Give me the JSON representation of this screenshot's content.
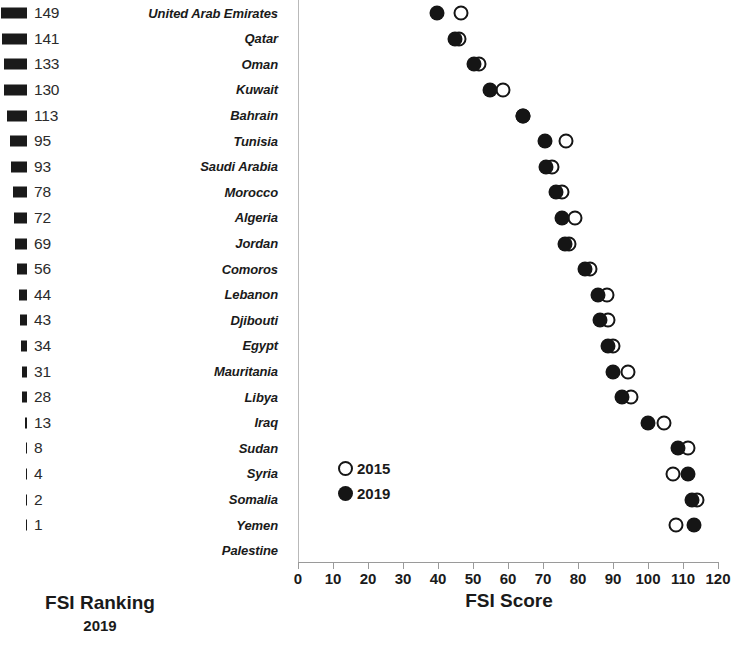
{
  "chart_data": {
    "type": "scatter",
    "title": "",
    "xlabel": "FSI Score",
    "ylabel": "",
    "xlim": [
      0,
      120
    ],
    "xticks": [
      0,
      10,
      20,
      30,
      40,
      50,
      60,
      70,
      80,
      90,
      100,
      110,
      120
    ],
    "grid": false,
    "legend_position": "inside-lower-left",
    "legend": [
      {
        "name": "2015",
        "marker": "open-circle",
        "color": "#151515"
      },
      {
        "name": "2019",
        "marker": "filled-circle",
        "color": "#151515"
      }
    ],
    "categories": [
      "United Arab Emirates",
      "Qatar",
      "Oman",
      "Kuwait",
      "Bahrain",
      "Tunisia",
      "Saudi Arabia",
      "Morocco",
      "Algeria",
      "Jordan",
      "Comoros",
      "Lebanon",
      "Djibouti",
      "Egypt",
      "Mauritania",
      "Libya",
      "Iraq",
      "Sudan",
      "Syria",
      "Somalia",
      "Yemen",
      "Palestine"
    ],
    "series": [
      {
        "name": "2015",
        "values": [
          46.6,
          46.0,
          51.7,
          58.6,
          64.3,
          76.6,
          72.6,
          75.4,
          79.1,
          77.4,
          83.4,
          88.3,
          88.6,
          90.0,
          94.3,
          95.1,
          104.5,
          111.4,
          107.1,
          114.0,
          108.0,
          null
        ]
      },
      {
        "name": "2019",
        "values": [
          39.7,
          44.9,
          50.3,
          54.9,
          64.3,
          70.6,
          70.9,
          73.7,
          75.4,
          76.3,
          82.0,
          85.7,
          86.3,
          88.6,
          90.0,
          92.6,
          100.0,
          108.6,
          111.4,
          112.6,
          113.1,
          null
        ]
      }
    ]
  },
  "rank_panel": {
    "caption_line1": "FSI Ranking",
    "caption_line2": "2019",
    "max_rank": 149,
    "rows": [
      {
        "rank": "149",
        "rank_value": 149,
        "country": "United Arab Emirates"
      },
      {
        "rank": "141",
        "rank_value": 141,
        "country": "Qatar"
      },
      {
        "rank": "133",
        "rank_value": 133,
        "country": "Oman"
      },
      {
        "rank": "130",
        "rank_value": 130,
        "country": "Kuwait"
      },
      {
        "rank": "113",
        "rank_value": 113,
        "country": "Bahrain"
      },
      {
        "rank": "95",
        "rank_value": 95,
        "country": "Tunisia"
      },
      {
        "rank": "93",
        "rank_value": 93,
        "country": "Saudi Arabia"
      },
      {
        "rank": "78",
        "rank_value": 78,
        "country": "Morocco"
      },
      {
        "rank": "72",
        "rank_value": 72,
        "country": "Algeria"
      },
      {
        "rank": "69",
        "rank_value": 69,
        "country": "Jordan"
      },
      {
        "rank": "56",
        "rank_value": 56,
        "country": "Comoros"
      },
      {
        "rank": "44",
        "rank_value": 44,
        "country": "Lebanon"
      },
      {
        "rank": "43",
        "rank_value": 43,
        "country": "Djibouti"
      },
      {
        "rank": "34",
        "rank_value": 34,
        "country": "Egypt"
      },
      {
        "rank": "31",
        "rank_value": 31,
        "country": "Mauritania"
      },
      {
        "rank": "28",
        "rank_value": 28,
        "country": "Libya"
      },
      {
        "rank": "13",
        "rank_value": 13,
        "country": "Iraq"
      },
      {
        "rank": "8",
        "rank_value": 8,
        "country": "Sudan"
      },
      {
        "rank": "4",
        "rank_value": 4,
        "country": "Syria"
      },
      {
        "rank": "2",
        "rank_value": 2,
        "country": "Somalia"
      },
      {
        "rank": "1",
        "rank_value": 1,
        "country": "Yemen"
      },
      {
        "rank": "",
        "rank_value": 0,
        "country": "Palestine"
      }
    ]
  },
  "colors": {
    "marker": "#151515",
    "axis": "#9a9a9a",
    "text": "#1a1a1a",
    "background": "#ffffff"
  }
}
